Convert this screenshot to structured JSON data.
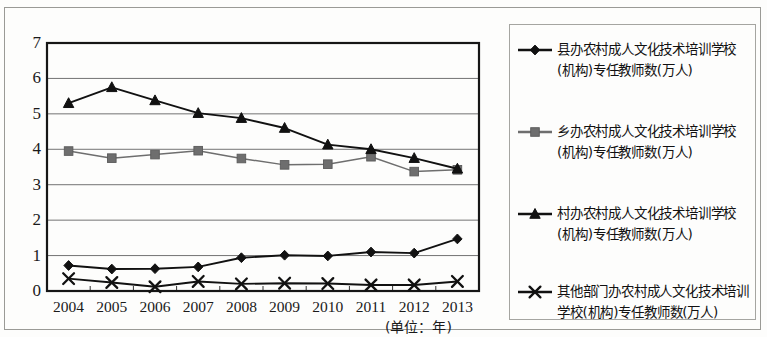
{
  "chart_data": {
    "type": "line",
    "title": "",
    "xlabel": "(单位：年)",
    "ylabel": "",
    "x": [
      2004,
      2005,
      2006,
      2007,
      2008,
      2009,
      2010,
      2011,
      2012,
      2013
    ],
    "categories": [
      "2004",
      "2005",
      "2006",
      "2007",
      "2008",
      "2009",
      "2010",
      "2011",
      "2012",
      "2013"
    ],
    "ylim": [
      0,
      7
    ],
    "yticks": [
      "0",
      "1",
      "2",
      "3",
      "4",
      "5",
      "6",
      "7"
    ],
    "grid": "horizontal",
    "legend_position": "right",
    "series": [
      {
        "name": "县办农村成人文化技术培训学校(机构)专任教师数(万人)",
        "marker": "diamond",
        "color": "#111111",
        "values": [
          0.72,
          0.62,
          0.63,
          0.68,
          0.94,
          1.01,
          0.99,
          1.1,
          1.07,
          1.47
        ]
      },
      {
        "name": "乡办农村成人文化技术培训学校(机构)专任教师数(万人)",
        "marker": "square",
        "color": "#6e6e6e",
        "values": [
          3.95,
          3.75,
          3.85,
          3.96,
          3.74,
          3.56,
          3.58,
          3.79,
          3.37,
          3.42
        ]
      },
      {
        "name": "村办农村成人文化技术培训学校(机构)专任教师数(万人)",
        "marker": "triangle",
        "color": "#111111",
        "values": [
          5.3,
          5.75,
          5.38,
          5.02,
          4.88,
          4.6,
          4.13,
          4.0,
          3.75,
          3.45
        ]
      },
      {
        "name": "其他部门办农村成人文化技术培训学校(机构)专任教师数(万人)",
        "marker": "cross",
        "color": "#111111",
        "values": [
          0.35,
          0.24,
          0.12,
          0.27,
          0.2,
          0.22,
          0.21,
          0.17,
          0.17,
          0.27
        ]
      }
    ]
  },
  "axis": {
    "yticks": [
      "0",
      "1",
      "2",
      "3",
      "4",
      "5",
      "6",
      "7"
    ],
    "xticks": [
      "2004",
      "2005",
      "2006",
      "2007",
      "2008",
      "2009",
      "2010",
      "2011",
      "2012",
      "2013"
    ],
    "unit_note": "(单位：年)"
  },
  "legend": {
    "items": [
      {
        "label": "县办农村成人文化技术培训学校(机构)专任教师数(万人)",
        "marker": "diamond-marker"
      },
      {
        "label": "乡办农村成人文化技术培训学校(机构)专任教师数(万人)",
        "marker": "square-marker"
      },
      {
        "label": "村办农村成人文化技术培训学校(机构)专任教师数(万人)",
        "marker": "triangle-marker"
      },
      {
        "label": "其他部门办农村成人文化技术培训学校(机构)专任教师数(万人)",
        "marker": "cross-marker"
      }
    ]
  }
}
